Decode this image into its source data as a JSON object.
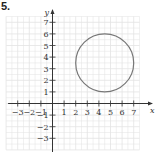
{
  "problem_number": "5.",
  "chart_data": {
    "type": "line",
    "title": "",
    "xlabel": "x",
    "ylabel": "y",
    "xlim": [
      -4,
      8
    ],
    "ylim": [
      -4,
      8
    ],
    "grid": true,
    "x_ticks": [
      -3,
      -2,
      -1,
      1,
      2,
      3,
      4,
      5,
      6,
      7
    ],
    "x_tick_labels": [
      "−3",
      "−2",
      "−1",
      "1",
      "2",
      "3",
      "4",
      "5",
      "6",
      "7"
    ],
    "y_ticks": [
      -3,
      -2,
      -1,
      1,
      2,
      3,
      4,
      5,
      6,
      7
    ],
    "y_tick_labels": [
      "−3",
      "−2",
      "−1",
      "1",
      "2",
      "3",
      "4",
      "5",
      "6",
      "7"
    ],
    "shapes": [
      {
        "type": "circle",
        "center": [
          4.5,
          3.5
        ],
        "radius": 2.5,
        "color": "#777777"
      }
    ]
  },
  "colors": {
    "grid": "#e3e3e3",
    "axis": "#333333",
    "curve": "#777777"
  }
}
